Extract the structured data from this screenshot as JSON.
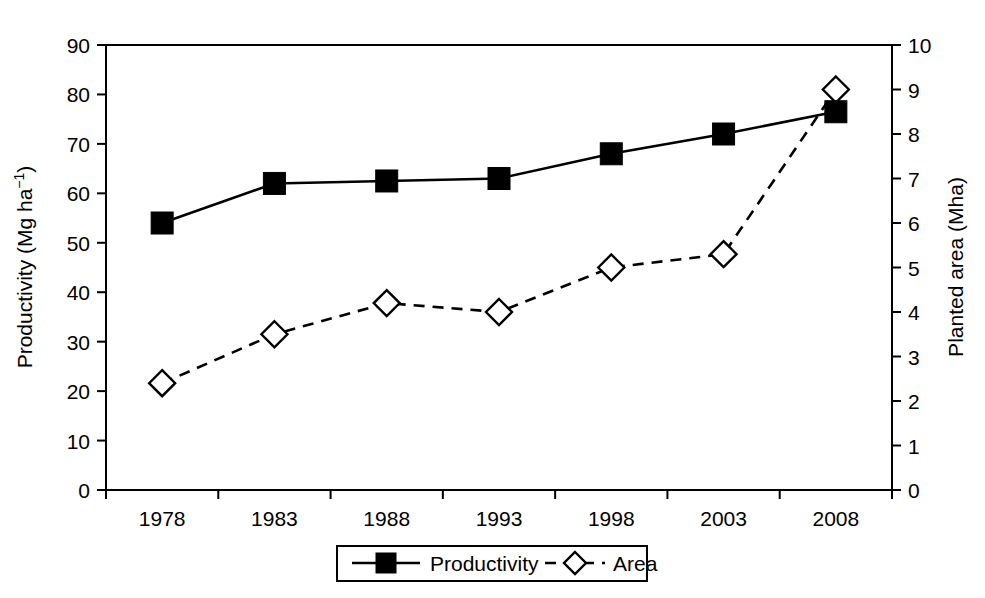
{
  "chart_data": {
    "type": "line",
    "title": "",
    "xlabel": "",
    "categories": [
      "1978",
      "1983",
      "1988",
      "1993",
      "1998",
      "2003",
      "2008"
    ],
    "series": [
      {
        "name": "Productivity",
        "axis": "left",
        "marker": "filled-square",
        "linestyle": "solid",
        "values": [
          54,
          62,
          62.5,
          63,
          68,
          72,
          76.5
        ]
      },
      {
        "name": "Area",
        "axis": "right",
        "marker": "open-diamond",
        "linestyle": "dashed",
        "values": [
          2.4,
          3.5,
          4.2,
          4.0,
          5.0,
          5.3,
          9.0
        ]
      }
    ],
    "axes": {
      "left": {
        "label": "Productivity (Mg ha",
        "label_sup": "−1",
        "label_tail": ")",
        "label_full": "Productivity (Mg ha−1)",
        "ticks": [
          "0",
          "10",
          "20",
          "30",
          "40",
          "50",
          "60",
          "70",
          "80",
          "90"
        ],
        "min": 0,
        "max": 90,
        "step": 10
      },
      "right": {
        "label": "Planted area (Mha)",
        "ticks": [
          "0",
          "1",
          "2",
          "3",
          "4",
          "5",
          "6",
          "7",
          "8",
          "9",
          "10"
        ],
        "min": 0,
        "max": 10,
        "step": 1
      },
      "x": {
        "ticks": [
          "1978",
          "1983",
          "1988",
          "1993",
          "1998",
          "2003",
          "2008"
        ]
      }
    },
    "legend": {
      "position": "bottom-center",
      "entries": [
        {
          "label": "Productivity",
          "marker": "filled-square",
          "linestyle": "solid"
        },
        {
          "label": "Area",
          "marker": "open-diamond",
          "linestyle": "dashed"
        }
      ]
    },
    "grid": false,
    "colors": {
      "line": "#000000",
      "background": "#ffffff",
      "marker_fill_productivity": "#000000",
      "marker_fill_area": "#ffffff"
    }
  }
}
